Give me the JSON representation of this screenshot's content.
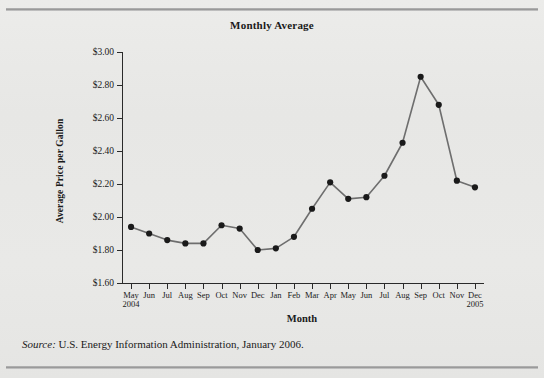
{
  "figure": {
    "title": "Monthly Average",
    "source_label": "Source:",
    "source_text": " U.S. Energy Information Administration, January 2006.",
    "background_color": "#e8e8e6",
    "line_color": "#6e6e6e",
    "marker_color": "#1a1a1a",
    "axis_color": "#2a2a2a"
  },
  "chart_data": {
    "type": "line",
    "title": "Monthly Average",
    "xlabel": "Month",
    "ylabel": "Average Price per Gallon",
    "ylim": [
      1.6,
      3.0
    ],
    "ytick_values": [
      1.6,
      1.8,
      2.0,
      2.2,
      2.4,
      2.6,
      2.8,
      3.0
    ],
    "ytick_labels": [
      "$1.60",
      "$1.80",
      "$2.00",
      "$2.20",
      "$2.40",
      "$2.60",
      "$2.80",
      "$3.00"
    ],
    "grid": false,
    "legend": "none",
    "categories": [
      "May",
      "Jun",
      "Jul",
      "Aug",
      "Sep",
      "Oct",
      "Nov",
      "Dec",
      "Jan",
      "Feb",
      "Mar",
      "Apr",
      "May",
      "Jun",
      "Jul",
      "Aug",
      "Sep",
      "Oct",
      "Nov",
      "Dec"
    ],
    "year_markers": [
      {
        "index": 0,
        "label": "2004"
      },
      {
        "index": 19,
        "label": "2005"
      }
    ],
    "values": [
      1.94,
      1.9,
      1.86,
      1.84,
      1.84,
      1.95,
      1.93,
      1.8,
      1.81,
      1.88,
      2.05,
      2.21,
      2.11,
      2.12,
      2.25,
      2.45,
      2.85,
      2.68,
      2.22,
      2.18
    ],
    "series": [
      {
        "name": "Average Price per Gallon",
        "values": [
          1.94,
          1.9,
          1.86,
          1.84,
          1.84,
          1.95,
          1.93,
          1.8,
          1.81,
          1.88,
          2.05,
          2.21,
          2.11,
          2.12,
          2.25,
          2.45,
          2.85,
          2.68,
          2.22,
          2.18
        ]
      }
    ]
  }
}
